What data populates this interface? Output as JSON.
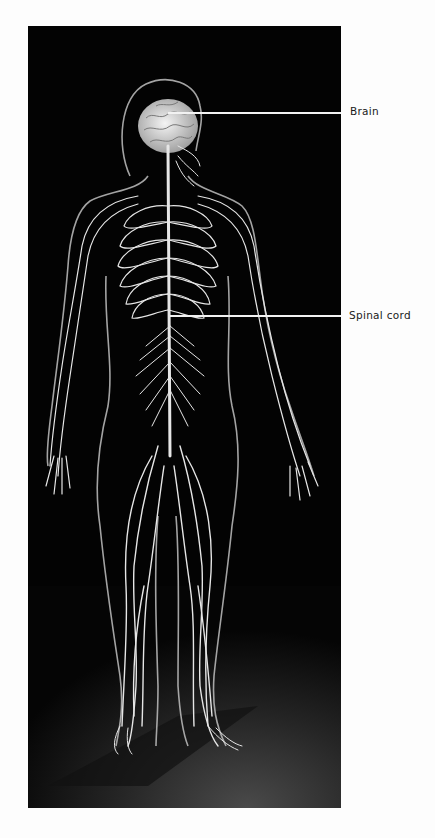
{
  "figure": {
    "background_color": "#000000",
    "nerve_color": "#e8e8e8",
    "labels": [
      {
        "id": "brain",
        "text": "Brain"
      },
      {
        "id": "spinal-cord",
        "text": "Spinal cord"
      }
    ]
  }
}
